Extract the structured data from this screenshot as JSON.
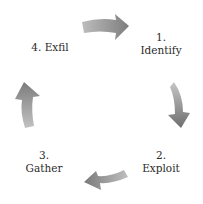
{
  "diagram": {
    "type": "cycle",
    "direction": "clockwise",
    "steps": [
      {
        "number": "1.",
        "label": "Identify"
      },
      {
        "number": "2.",
        "label": "Exploit"
      },
      {
        "number": "3.",
        "label": "Gather"
      },
      {
        "number": "4.",
        "label": "Exfil"
      }
    ],
    "arrows": [
      {
        "from": "4. Exfil",
        "to": "1. Identify",
        "icon": "arrow-right-icon"
      },
      {
        "from": "1. Identify",
        "to": "2. Exploit",
        "icon": "arrow-down-icon"
      },
      {
        "from": "2. Exploit",
        "to": "3. Gather",
        "icon": "arrow-left-icon"
      },
      {
        "from": "3. Gather",
        "to": "4. Exfil",
        "icon": "arrow-up-icon"
      }
    ],
    "colors": {
      "arrow_light": "#c4c4c4",
      "arrow_dark": "#7a7a7a",
      "text": "#2b2b2b",
      "background": "#ffffff"
    }
  }
}
